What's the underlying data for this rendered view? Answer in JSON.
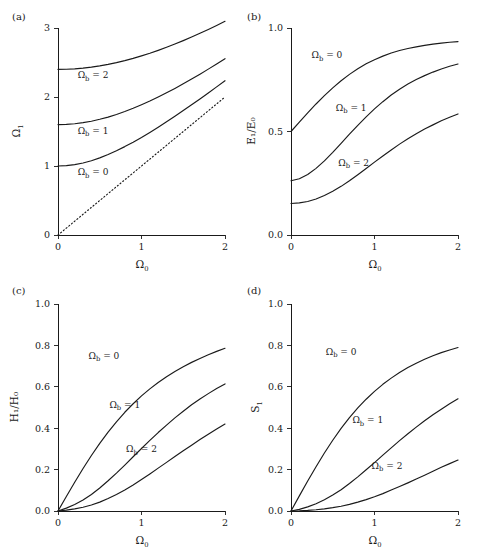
{
  "figure": {
    "background": "#ffffff",
    "ink": "#1a1a1a",
    "panel_count": 4
  },
  "panels": {
    "a": {
      "tag": "(a)",
      "ylabel": "Ω",
      "ylabel_sub": "1",
      "xlabel": "Ω",
      "xlabel_sub": "0"
    },
    "b": {
      "tag": "(b)",
      "ylabel": "E₁/E₀",
      "xlabel": "Ω",
      "xlabel_sub": "0"
    },
    "c": {
      "tag": "(c)",
      "ylabel": "H₁/H₀",
      "xlabel": "Ω",
      "xlabel_sub": "0"
    },
    "d": {
      "tag": "(d)",
      "ylabel": "S",
      "ylabel_sub": "1",
      "xlabel": "Ω",
      "xlabel_sub": "0"
    }
  },
  "series_labels": {
    "omega_b_0": "Ωb = 0",
    "omega_b_1": "Ωb = 1",
    "omega_b_2": "Ωb = 2",
    "prefix": "Ω",
    "sub": "b",
    "eq0": "= 0",
    "eq1": "= 1",
    "eq2": "= 2"
  },
  "chart_data": [
    {
      "id": "panel-a",
      "type": "line",
      "title": "(a)",
      "xlabel": "Ω₀",
      "ylabel": "Ω₁",
      "xlim": [
        0,
        2
      ],
      "ylim": [
        0,
        3
      ],
      "xticks": [
        0,
        1,
        2
      ],
      "xticklabels": [
        "0",
        "1",
        "2"
      ],
      "yticks": [
        0,
        1,
        2,
        3
      ],
      "yticklabels": [
        "0",
        "1",
        "2",
        "3"
      ],
      "grid": false,
      "legend": "inline-annotations",
      "x": [
        0,
        0.1,
        0.2,
        0.3,
        0.4,
        0.5,
        0.6,
        0.7,
        0.8,
        0.9,
        1.0,
        1.1,
        1.2,
        1.3,
        1.4,
        1.5,
        1.6,
        1.7,
        1.8,
        1.9,
        2.0
      ],
      "series": [
        {
          "name": "Ωb = 0",
          "style": "solid",
          "label_xy": [
            0.42,
            0.87
          ],
          "values": [
            1.0,
            1.005,
            1.02,
            1.044,
            1.077,
            1.118,
            1.166,
            1.221,
            1.281,
            1.345,
            1.414,
            1.487,
            1.562,
            1.64,
            1.72,
            1.803,
            1.887,
            1.972,
            2.059,
            2.147,
            2.236
          ]
        },
        {
          "name": "Ωb = 1",
          "style": "solid",
          "label_xy": [
            0.42,
            1.47
          ],
          "values": [
            1.6,
            1.603,
            1.612,
            1.628,
            1.649,
            1.677,
            1.709,
            1.747,
            1.789,
            1.836,
            1.887,
            1.941,
            1.999,
            2.06,
            2.124,
            2.191,
            2.26,
            2.331,
            2.404,
            2.479,
            2.556
          ]
        },
        {
          "name": "Ωb = 2",
          "style": "solid",
          "label_xy": [
            0.42,
            2.27
          ],
          "values": [
            2.4,
            2.402,
            2.408,
            2.419,
            2.433,
            2.451,
            2.473,
            2.499,
            2.528,
            2.56,
            2.596,
            2.634,
            2.676,
            2.72,
            2.767,
            2.817,
            2.869,
            2.923,
            2.979,
            3.037,
            3.097
          ]
        },
        {
          "name": "reference Ω₁ = Ω₀",
          "style": "dotted",
          "values": [
            0,
            0.1,
            0.2,
            0.3,
            0.4,
            0.5,
            0.6,
            0.7,
            0.8,
            0.9,
            1.0,
            1.1,
            1.2,
            1.3,
            1.4,
            1.5,
            1.6,
            1.7,
            1.8,
            1.9,
            2.0
          ]
        }
      ]
    },
    {
      "id": "panel-b",
      "type": "line",
      "title": "(b)",
      "xlabel": "Ω₀",
      "ylabel": "E₁/E₀",
      "xlim": [
        0,
        2
      ],
      "ylim": [
        0,
        1
      ],
      "xticks": [
        0,
        1,
        2
      ],
      "xticklabels": [
        "0",
        "1",
        "2"
      ],
      "yticks": [
        0.0,
        0.5,
        1.0
      ],
      "yticklabels": [
        "0.0",
        "0.5",
        "1.0"
      ],
      "grid": false,
      "legend": "inline-annotations",
      "x": [
        0,
        0.1,
        0.2,
        0.3,
        0.4,
        0.5,
        0.6,
        0.7,
        0.8,
        0.9,
        1.0,
        1.1,
        1.2,
        1.3,
        1.4,
        1.5,
        1.6,
        1.7,
        1.8,
        1.9,
        2.0
      ],
      "series": [
        {
          "name": "Ωb = 0",
          "style": "solid",
          "label_xy": [
            0.43,
            0.855
          ],
          "values": [
            0.5,
            0.545,
            0.59,
            0.633,
            0.673,
            0.711,
            0.745,
            0.776,
            0.803,
            0.827,
            0.847,
            0.864,
            0.879,
            0.891,
            0.901,
            0.909,
            0.916,
            0.922,
            0.927,
            0.931,
            0.934
          ]
        },
        {
          "name": "Ωb = 1",
          "style": "solid",
          "label_xy": [
            0.72,
            0.6
          ],
          "values": [
            0.262,
            0.272,
            0.292,
            0.322,
            0.358,
            0.399,
            0.443,
            0.487,
            0.53,
            0.571,
            0.609,
            0.644,
            0.676,
            0.704,
            0.729,
            0.751,
            0.77,
            0.787,
            0.802,
            0.815,
            0.826
          ]
        },
        {
          "name": "Ωb = 2",
          "style": "solid",
          "label_xy": [
            0.75,
            0.335
          ],
          "values": [
            0.152,
            0.155,
            0.162,
            0.174,
            0.191,
            0.211,
            0.235,
            0.262,
            0.291,
            0.321,
            0.352,
            0.382,
            0.411,
            0.439,
            0.465,
            0.489,
            0.512,
            0.532,
            0.552,
            0.569,
            0.585
          ]
        }
      ]
    },
    {
      "id": "panel-c",
      "type": "line",
      "title": "(c)",
      "xlabel": "Ω₀",
      "ylabel": "H₁/H₀",
      "xlim": [
        0,
        2
      ],
      "ylim": [
        0,
        1
      ],
      "xticks": [
        0,
        1,
        2
      ],
      "xticklabels": [
        "0",
        "1",
        "2"
      ],
      "yticks": [
        0.0,
        0.2,
        0.4,
        0.6,
        0.8,
        1.0
      ],
      "yticklabels": [
        "0.0",
        "0.2",
        "0.4",
        "0.6",
        "0.8",
        "1.0"
      ],
      "grid": false,
      "legend": "inline-annotations",
      "x": [
        0,
        0.1,
        0.2,
        0.3,
        0.4,
        0.5,
        0.6,
        0.7,
        0.8,
        0.9,
        1.0,
        1.1,
        1.2,
        1.3,
        1.4,
        1.5,
        1.6,
        1.7,
        1.8,
        1.9,
        2.0
      ],
      "series": [
        {
          "name": "Ωb = 0",
          "style": "solid",
          "label_xy": [
            0.55,
            0.735
          ],
          "values": [
            0.0,
            0.07,
            0.139,
            0.205,
            0.268,
            0.327,
            0.381,
            0.431,
            0.477,
            0.518,
            0.556,
            0.59,
            0.621,
            0.649,
            0.674,
            0.697,
            0.718,
            0.737,
            0.755,
            0.771,
            0.786
          ]
        },
        {
          "name": "Ωb = 1",
          "style": "solid",
          "label_xy": [
            0.8,
            0.5
          ],
          "values": [
            0.0,
            0.014,
            0.031,
            0.053,
            0.08,
            0.111,
            0.146,
            0.183,
            0.222,
            0.262,
            0.302,
            0.341,
            0.379,
            0.415,
            0.45,
            0.482,
            0.513,
            0.541,
            0.567,
            0.592,
            0.614
          ]
        },
        {
          "name": "Ωb = 2",
          "style": "solid",
          "label_xy": [
            1.0,
            0.285
          ],
          "values": [
            0.0,
            0.004,
            0.01,
            0.018,
            0.029,
            0.043,
            0.06,
            0.08,
            0.102,
            0.126,
            0.152,
            0.179,
            0.207,
            0.235,
            0.263,
            0.291,
            0.318,
            0.345,
            0.371,
            0.396,
            0.42
          ]
        }
      ]
    },
    {
      "id": "panel-d",
      "type": "line",
      "title": "(d)",
      "xlabel": "Ω₀",
      "ylabel": "S₁",
      "xlim": [
        0,
        2
      ],
      "ylim": [
        0,
        1
      ],
      "xticks": [
        0,
        1,
        2
      ],
      "xticklabels": [
        "0",
        "1",
        "2"
      ],
      "yticks": [
        0.0,
        0.2,
        0.4,
        0.6,
        0.8,
        1.0
      ],
      "yticklabels": [
        "0.0",
        "0.2",
        "0.4",
        "0.6",
        "0.8",
        "1.0"
      ],
      "grid": false,
      "legend": "inline-annotations",
      "x": [
        0,
        0.1,
        0.2,
        0.3,
        0.4,
        0.5,
        0.6,
        0.7,
        0.8,
        0.9,
        1.0,
        1.1,
        1.2,
        1.3,
        1.4,
        1.5,
        1.6,
        1.7,
        1.8,
        1.9,
        2.0
      ],
      "series": [
        {
          "name": "Ωb = 0",
          "style": "solid",
          "label_xy": [
            0.6,
            0.755
          ],
          "values": [
            0.0,
            0.073,
            0.145,
            0.214,
            0.28,
            0.342,
            0.399,
            0.451,
            0.498,
            0.54,
            0.578,
            0.612,
            0.642,
            0.669,
            0.693,
            0.714,
            0.733,
            0.75,
            0.765,
            0.778,
            0.79
          ]
        },
        {
          "name": "Ωb = 1",
          "style": "solid",
          "label_xy": [
            0.92,
            0.425
          ],
          "values": [
            0.0,
            0.008,
            0.02,
            0.035,
            0.054,
            0.077,
            0.103,
            0.133,
            0.165,
            0.199,
            0.234,
            0.27,
            0.305,
            0.34,
            0.373,
            0.405,
            0.436,
            0.465,
            0.492,
            0.518,
            0.542
          ]
        },
        {
          "name": "Ωb = 2",
          "style": "solid",
          "label_xy": [
            1.15,
            0.205
          ],
          "values": [
            0.0,
            0.001,
            0.003,
            0.006,
            0.01,
            0.016,
            0.023,
            0.032,
            0.043,
            0.055,
            0.069,
            0.084,
            0.101,
            0.118,
            0.136,
            0.155,
            0.173,
            0.192,
            0.211,
            0.229,
            0.246
          ]
        }
      ]
    }
  ]
}
